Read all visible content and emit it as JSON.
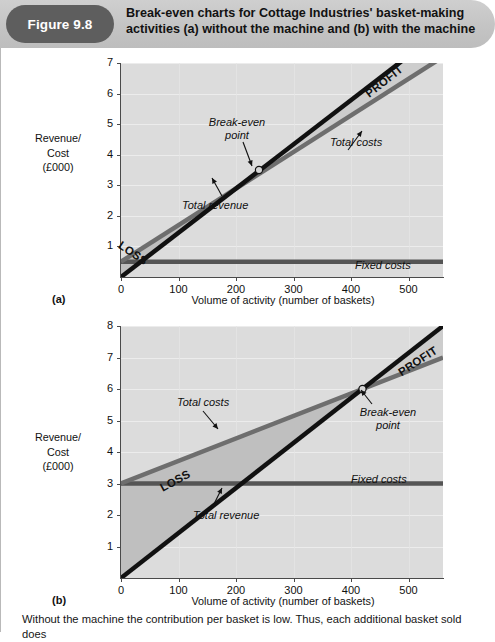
{
  "figure": {
    "badge_label": "Figure 9.8",
    "title_line1": "Break-even charts for Cottage Industries' basket-making",
    "title_line2": "activities (a) without the machine and (b) with the machine",
    "badge_color": "#5e5e5e",
    "band_color": "#c4c4c4"
  },
  "caption": "Without the machine the contribution per basket is low. Thus, each additional basket sold does",
  "chart_data": [
    {
      "type": "line",
      "panel": "(a)",
      "title": "",
      "xlabel": "Volume of activity (number of baskets)",
      "ylabel": "Revenue/ Cost (£000)",
      "ylabel_line1": "Revenue/",
      "ylabel_line2": "Cost",
      "ylabel_line3": "(£000)",
      "xlim": [
        0,
        560
      ],
      "ylim": [
        0,
        7
      ],
      "xticks": [
        0,
        100,
        200,
        300,
        400,
        500
      ],
      "yticks": [
        1,
        2,
        3,
        4,
        5,
        6,
        7
      ],
      "grid": true,
      "series": [
        {
          "name": "Fixed costs",
          "color": "#555555",
          "x": [
            0,
            560
          ],
          "y": [
            0.5,
            0.5
          ],
          "label": "Fixed costs",
          "label_x": 430,
          "label_y": 0.28
        },
        {
          "name": "Total costs",
          "color": "#6e6e6e",
          "x": [
            0,
            560
          ],
          "y": [
            0.5,
            7.2
          ],
          "label": "Total costs",
          "label_x": 330,
          "label_y": 4.9
        },
        {
          "name": "Total revenue",
          "color": "#111111",
          "x": [
            0,
            560
          ],
          "y": [
            0.0,
            8.1
          ],
          "label": "Total revenue",
          "label_x": 200,
          "label_y": 1.85
        }
      ],
      "break_even": {
        "label_line1": "Break-even",
        "label_line2": "point",
        "x": 240,
        "y": 3.5
      },
      "zones": [
        {
          "label": "LOSS",
          "x": 35,
          "y": 0.85
        },
        {
          "label": "PROFIT",
          "x": 440,
          "y": 6.3
        }
      ]
    },
    {
      "type": "line",
      "panel": "(b)",
      "title": "",
      "xlabel": "Volume of activity (number of baskets)",
      "ylabel": "Revenue/ Cost (£000)",
      "ylabel_line1": "Revenue/",
      "ylabel_line2": "Cost",
      "ylabel_line3": "(£000)",
      "xlim": [
        0,
        560
      ],
      "ylim": [
        0,
        8
      ],
      "xticks": [
        0,
        100,
        200,
        300,
        400,
        500
      ],
      "yticks": [
        1,
        2,
        3,
        4,
        5,
        6,
        7,
        8
      ],
      "grid": true,
      "series": [
        {
          "name": "Fixed costs",
          "color": "#555555",
          "x": [
            0,
            560
          ],
          "y": [
            3.0,
            3.0
          ],
          "label": "Fixed costs",
          "label_x": 415,
          "label_y": 2.72
        },
        {
          "name": "Total costs",
          "color": "#6e6e6e",
          "x": [
            0,
            560
          ],
          "y": [
            3.0,
            7.0
          ],
          "label": "Total costs",
          "label_x": 150,
          "label_y": 5.35
        },
        {
          "name": "Total revenue",
          "color": "#111111",
          "x": [
            0,
            560
          ],
          "y": [
            0.0,
            8.0
          ],
          "label": "Total revenue",
          "label_x": 190,
          "label_y": 1.6
        }
      ],
      "break_even": {
        "label_line1": "Break-even",
        "label_line2": "point",
        "x": 420,
        "y": 6.0
      },
      "zones": [
        {
          "label": "LOSS",
          "x": 95,
          "y": 2.25
        },
        {
          "label": "PROFIT",
          "x": 460,
          "y": 7.2
        }
      ]
    }
  ]
}
